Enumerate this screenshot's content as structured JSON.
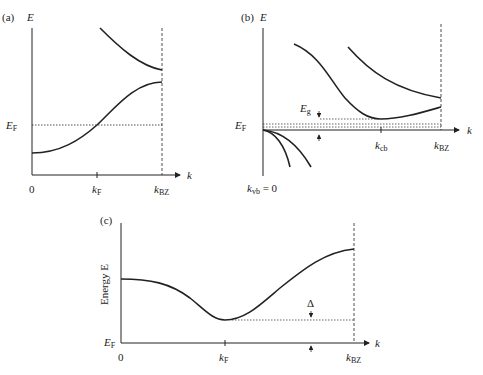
{
  "panels": {
    "a": {
      "tag": "(a)",
      "y_label": "E",
      "x_label": "k",
      "fermi_label": "E",
      "fermi_sub": "F",
      "ticks": [
        {
          "main": "0",
          "sub": ""
        },
        {
          "main": "k",
          "sub": "F"
        },
        {
          "main": "k",
          "sub": "BZ"
        }
      ]
    },
    "b": {
      "tag": "(b)",
      "y_label": "E",
      "x_label": "k",
      "fermi_label": "E",
      "fermi_sub": "F",
      "gap_label": "E",
      "gap_sub": "g",
      "ticks": [
        {
          "main": "k",
          "sub": "cb"
        },
        {
          "main": "k",
          "sub": "BZ"
        }
      ],
      "origin_label": "k",
      "origin_sub": "vb",
      "origin_value": " = 0"
    },
    "c": {
      "tag": "(c)",
      "y_label": "Energy E",
      "x_label": "k",
      "fermi_label": "E",
      "fermi_sub": "F",
      "gap_label": "Δ",
      "ticks": [
        {
          "main": "0",
          "sub": ""
        },
        {
          "main": "k",
          "sub": "F"
        },
        {
          "main": "k",
          "sub": "BZ"
        }
      ]
    }
  },
  "colors": {
    "line": "#222222",
    "background": "#ffffff"
  }
}
